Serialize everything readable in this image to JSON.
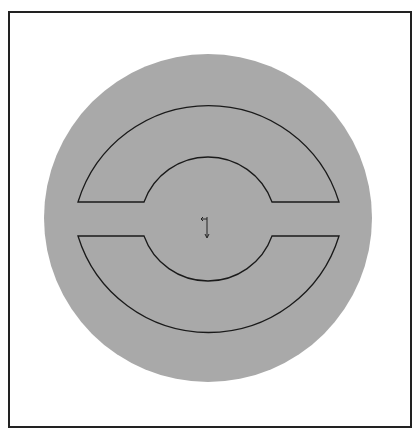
{
  "diagram": {
    "type": "cad-cross-section",
    "frame": {
      "x": 9,
      "y": 12,
      "width": 402,
      "height": 415,
      "stroke": "#222222"
    },
    "disk": {
      "cx": 208,
      "cy": 218,
      "r": 164,
      "fill": "#a9a9a9"
    },
    "upper_part": {
      "path": "M 78 202 A 136.5 136.5 0 0 1 339 202 L 272 202 A 68 68 0 0 0 144 202 Z"
    },
    "lower_part": {
      "path": "M 78 236 L 144 236 A 68 68 0 0 0 272 236 L 339 236 A 136.5 136.5 0 0 1 78 236 Z"
    },
    "outline_color": "#1a1a1a",
    "origin_marker": {
      "x": 207,
      "y": 219,
      "icon": "coordinate-origin-icon"
    }
  }
}
